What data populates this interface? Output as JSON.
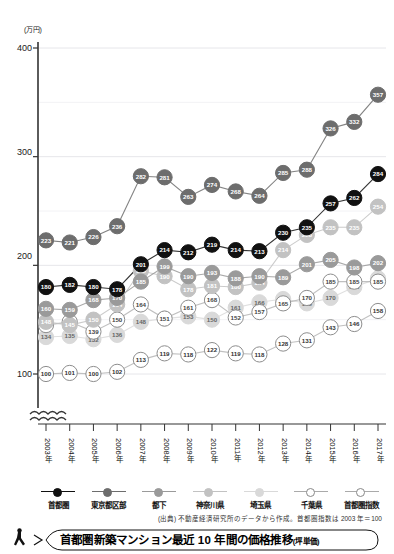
{
  "chart_data": {
    "type": "line",
    "title": "首都圏新築マンション最近 10 年間の価格推移",
    "title_note": "(坪単価)",
    "unit_label": "(万円)",
    "xlabel": "",
    "ylabel": "",
    "ylim": [
      90,
      400
    ],
    "yticks": [
      100,
      200,
      300,
      400
    ],
    "grid": true,
    "axis_break": true,
    "legend_position": "bottom",
    "categories": [
      "2003年",
      "2004年",
      "2005年",
      "2006年",
      "2007年",
      "2008年",
      "2009年",
      "2010年",
      "2011年",
      "2012年",
      "2013年",
      "2014年",
      "2015年",
      "2016年",
      "2017年"
    ],
    "series": [
      {
        "name": "首都圏",
        "color": "#111111",
        "text": "#ffffff",
        "values": [
          180,
          182,
          180,
          178,
          201,
          214,
          212,
          219,
          214,
          213,
          230,
          235,
          257,
          262,
          284
        ]
      },
      {
        "name": "東京都区部",
        "color": "#6d6d6d",
        "text": "#ffffff",
        "values": [
          223,
          221,
          226,
          236,
          282,
          281,
          263,
          274,
          268,
          264,
          285,
          288,
          326,
          332,
          357
        ]
      },
      {
        "name": "都下",
        "color": "#9a9a9a",
        "text": "#ffffff",
        "values": [
          160,
          159,
          168,
          170,
          185,
          199,
          190,
          193,
          188,
          190,
          189,
          201,
          205,
          198,
          202
        ]
      },
      {
        "name": "神奈川県",
        "color": "#c2c2c2",
        "text": "#ffffff",
        "values": [
          148,
          145,
          150,
          164,
          195,
          190,
          178,
          181,
          180,
          184,
          214,
          228,
          235,
          235,
          254
        ]
      },
      {
        "name": "埼玉県",
        "color": "#d9d9d9",
        "text": "#666666",
        "values": [
          134,
          135,
          132,
          136,
          148,
          151,
          153,
          150,
          161,
          166,
          169,
          165,
          170,
          180,
          188
        ]
      },
      {
        "name": "千葉県",
        "color": "#ffffff",
        "text": "#444444",
        "values": [
          145,
          148,
          139,
          150,
          164,
          151,
          161,
          168,
          152,
          157,
          165,
          170,
          185,
          185,
          185
        ]
      },
      {
        "name": "首都圏指数",
        "color": "#ffffff",
        "text": "#333333",
        "values": [
          100,
          101,
          100,
          102,
          113,
          119,
          118,
          122,
          119,
          118,
          128,
          131,
          143,
          146,
          158
        ]
      }
    ],
    "annotations": {
      "source": "(出典) 不動産経済研究所のデータから作成。首都圏指数は 2003 年＝100"
    }
  },
  "legend": {
    "items": [
      {
        "label": "首都圏"
      },
      {
        "label": "東京都区部"
      },
      {
        "label": "都下"
      },
      {
        "label": "神奈川県"
      },
      {
        "label": "埼玉県"
      },
      {
        "label": "千葉県"
      },
      {
        "label": "首都圏指数"
      }
    ]
  },
  "caption": {
    "main": "首都圏新築マンション最近 10 年間の価格推移",
    "sub": "(坪単価)"
  }
}
